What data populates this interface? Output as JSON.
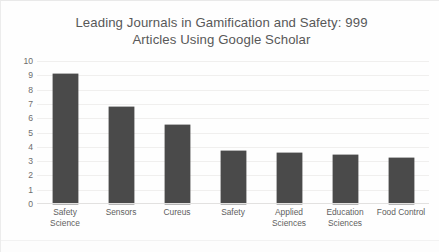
{
  "chart_data": {
    "type": "bar",
    "title": "Leading Journals in Gamification and Safety: 999 Articles Using Google Scholar",
    "title_lines": [
      "Leading Journals in Gamification and Safety: 999",
      "Articles Using Google Scholar"
    ],
    "xlabel": "",
    "ylabel": "",
    "ylim": [
      0,
      10
    ],
    "yticks": [
      10,
      9,
      8,
      7,
      6,
      5,
      4,
      3,
      2,
      1,
      0
    ],
    "grid": true,
    "legend": "none",
    "bar_color": "#4a4a4a",
    "categories": [
      "Safety Science",
      "Sensors",
      "Cureus",
      "Safety",
      "Applied Sciences",
      "Education Sciences",
      "Food Control"
    ],
    "category_lines": [
      [
        "Safety Science"
      ],
      [
        "Sensors"
      ],
      [
        "Cureus"
      ],
      [
        "Safety"
      ],
      [
        "Applied",
        "Sciences"
      ],
      [
        "Education",
        "Sciences"
      ],
      [
        "Food Control"
      ]
    ],
    "values": [
      9.1,
      6.8,
      5.5,
      3.7,
      3.6,
      3.4,
      3.2
    ]
  }
}
